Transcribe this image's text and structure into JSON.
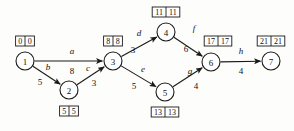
{
  "diagram": {
    "type": "directed-network",
    "nodes": [
      {
        "id": "1",
        "label": "1",
        "cx": 25,
        "cy": 61,
        "r": 9,
        "time_box": {
          "early": "0",
          "late": "0",
          "x": 25,
          "y": 41,
          "position": "above"
        }
      },
      {
        "id": "2",
        "label": "2",
        "cx": 69,
        "cy": 90,
        "r": 9,
        "time_box": {
          "early": "5",
          "late": "5",
          "x": 69,
          "y": 111,
          "position": "below"
        }
      },
      {
        "id": "3",
        "label": "3",
        "cx": 113,
        "cy": 61,
        "r": 9,
        "time_box": {
          "early": "8",
          "late": "8",
          "x": 113,
          "y": 41,
          "position": "above"
        }
      },
      {
        "id": "4",
        "label": "4",
        "cx": 166,
        "cy": 32,
        "r": 9,
        "time_box": {
          "early": "11",
          "late": "11",
          "x": 166,
          "y": 12,
          "position": "above"
        }
      },
      {
        "id": "5",
        "label": "5",
        "cx": 165,
        "cy": 92,
        "r": 9,
        "time_box": {
          "early": "13",
          "late": "13",
          "x": 165,
          "y": 112,
          "position": "below"
        }
      },
      {
        "id": "6",
        "label": "6",
        "cx": 211,
        "cy": 62,
        "r": 9,
        "time_box": {
          "early": "17",
          "late": "17",
          "x": 218,
          "y": 41,
          "position": "above"
        }
      },
      {
        "id": "7",
        "label": "7",
        "cx": 271,
        "cy": 61,
        "r": 9,
        "time_box": {
          "early": "21",
          "late": "21",
          "x": 271,
          "y": 41,
          "position": "above"
        }
      }
    ],
    "edges": [
      {
        "id": "a",
        "name": "a",
        "weight": "8",
        "from": "1",
        "to": "3",
        "name_x": 72,
        "name_y": 54,
        "weight_x": 72,
        "weight_y": 74
      },
      {
        "id": "b",
        "name": "b",
        "weight": "5",
        "from": "1",
        "to": "2",
        "name_x": 48,
        "name_y": 70,
        "weight_x": 40,
        "weight_y": 85
      },
      {
        "id": "c",
        "name": "c",
        "weight": "3",
        "from": "2",
        "to": "3",
        "name_x": 88,
        "name_y": 71,
        "weight_x": 94,
        "weight_y": 86
      },
      {
        "id": "d",
        "name": "d",
        "weight": "3",
        "from": "3",
        "to": "4",
        "name_x": 139,
        "name_y": 36,
        "weight_x": 133,
        "weight_y": 53
      },
      {
        "id": "e",
        "name": "e",
        "weight": "5",
        "from": "3",
        "to": "5",
        "name_x": 143,
        "name_y": 72,
        "weight_x": 134,
        "weight_y": 89
      },
      {
        "id": "f",
        "name": "f",
        "weight": "6",
        "from": "4",
        "to": "6",
        "name_x": 194,
        "name_y": 31,
        "weight_x": 186,
        "weight_y": 52
      },
      {
        "id": "g",
        "name": "g",
        "weight": "4",
        "from": "5",
        "to": "6",
        "name_x": 190,
        "name_y": 74,
        "weight_x": 196,
        "weight_y": 89
      },
      {
        "id": "h",
        "name": "h",
        "weight": "4",
        "from": "6",
        "to": "7",
        "name_x": 241,
        "name_y": 54,
        "weight_x": 241,
        "weight_y": 74
      }
    ]
  }
}
